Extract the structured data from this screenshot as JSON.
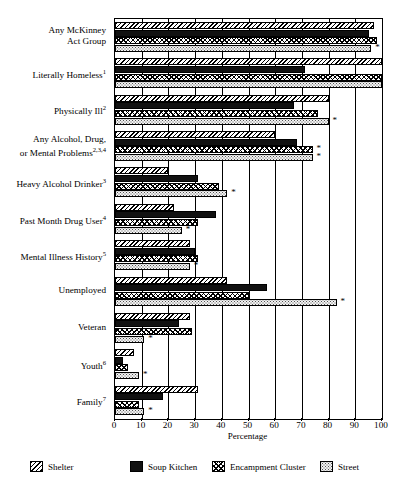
{
  "chart_data": {
    "type": "bar",
    "orientation": "horizontal",
    "title": "",
    "xlabel": "Percentage",
    "ylabel": "",
    "xlim": [
      0,
      100
    ],
    "xticks": [
      0,
      10,
      20,
      30,
      40,
      50,
      60,
      70,
      80,
      90,
      100
    ],
    "grid": true,
    "legend_position": "bottom",
    "categories": [
      "Any McKinney Act Group",
      "Literally Homeless",
      "Physically Ill",
      "Any Alcohol, Drug, or Mental Problems",
      "Heavy Alcohol Drinker",
      "Past Month Drug User",
      "Mental Illness History",
      "Unemployed",
      "Veteran",
      "Youth",
      "Family"
    ],
    "category_footnotes": [
      "",
      "1",
      "2",
      "2,3,4",
      "3",
      "4",
      "5",
      "",
      "",
      "6",
      "7"
    ],
    "series": [
      {
        "name": "Shelter",
        "pattern": "diagonal-hatch",
        "values": [
          97,
          100,
          80,
          60,
          20,
          22,
          28,
          42,
          28,
          7,
          31
        ]
      },
      {
        "name": "Soup Kitchen",
        "pattern": "solid-black",
        "values": [
          95,
          71,
          67,
          68,
          31,
          38,
          30,
          57,
          24,
          3,
          18
        ]
      },
      {
        "name": "Encampment Cluster",
        "pattern": "crosshatch",
        "values": [
          98,
          100,
          76,
          74,
          39,
          31,
          31,
          50,
          29,
          5,
          9
        ]
      },
      {
        "name": "Street",
        "pattern": "light-dotted",
        "values": [
          96,
          100,
          80,
          74,
          42,
          25,
          28,
          83,
          11,
          9,
          11
        ]
      }
    ],
    "significance_markers": [
      {
        "category": "Any McKinney Act Group",
        "series": "Street",
        "marker": "*"
      },
      {
        "category": "Physically Ill",
        "series": "Street",
        "marker": "*"
      },
      {
        "category": "Any Alcohol, Drug, or Mental Problems",
        "series": "Encampment Cluster",
        "marker": "*"
      },
      {
        "category": "Any Alcohol, Drug, or Mental Problems",
        "series": "Street",
        "marker": "*"
      },
      {
        "category": "Heavy Alcohol Drinker",
        "series": "Street",
        "marker": "*"
      },
      {
        "category": "Past Month Drug User",
        "series": "Street",
        "marker": "*"
      },
      {
        "category": "Mental Illness History",
        "series": "Street",
        "marker": "*"
      },
      {
        "category": "Unemployed",
        "series": "Street",
        "marker": "*"
      },
      {
        "category": "Veteran",
        "series": "Street",
        "marker": "*"
      },
      {
        "category": "Youth",
        "series": "Street",
        "marker": "*"
      },
      {
        "category": "Family",
        "series": "Street",
        "marker": "*"
      }
    ]
  },
  "axis": {
    "xlabel": "Percentage",
    "tick_labels": [
      "0",
      "10",
      "20",
      "30",
      "40",
      "50",
      "60",
      "70",
      "80",
      "90",
      "100"
    ]
  },
  "categories_display": [
    {
      "label": "Any McKinney",
      "label2": "Act Group",
      "sup": ""
    },
    {
      "label": "Literally Homeless",
      "label2": "",
      "sup": "1"
    },
    {
      "label": "Physically Ill",
      "label2": "",
      "sup": "2"
    },
    {
      "label": "Any Alcohol, Drug,",
      "label2": "or Mental Problems",
      "sup": "2,3,4"
    },
    {
      "label": "Heavy Alcohol Drinker",
      "label2": "",
      "sup": "3"
    },
    {
      "label": "Past Month Drug User",
      "label2": "",
      "sup": "4"
    },
    {
      "label": "Mental Illness History",
      "label2": "",
      "sup": "5"
    },
    {
      "label": "Unemployed",
      "label2": "",
      "sup": ""
    },
    {
      "label": "Veteran",
      "label2": "",
      "sup": ""
    },
    {
      "label": "Youth",
      "label2": "",
      "sup": "6"
    },
    {
      "label": "Family",
      "label2": "",
      "sup": "7"
    }
  ],
  "legend": {
    "items": [
      {
        "label": "Shelter",
        "pattern": "diagonal-hatch"
      },
      {
        "label": "Soup Kitchen",
        "pattern": "solid-black"
      },
      {
        "label": "Encampment Cluster",
        "pattern": "crosshatch"
      },
      {
        "label": "Street",
        "pattern": "light-dotted"
      }
    ]
  }
}
